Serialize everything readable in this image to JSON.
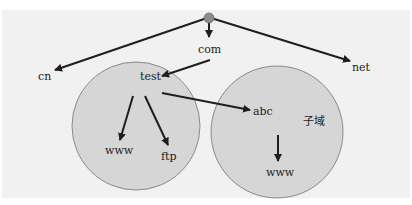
{
  "diagram": {
    "colors": {
      "background": "#f1f1f1",
      "zone_fill": "#d6d6d6",
      "zone_stroke": "#8a8a8a",
      "arrow": "#1e1e1e",
      "root_node": "#8c8c8c"
    },
    "nodes": {
      "root": "",
      "cn": "cn",
      "com": "com",
      "net": "net",
      "test": "test",
      "www1": "www",
      "ftp": "ftp",
      "abc": "abc",
      "www2": "www",
      "subdomain_label": "子域"
    },
    "edges": [
      {
        "from": "root",
        "to": "cn"
      },
      {
        "from": "root",
        "to": "com"
      },
      {
        "from": "root",
        "to": "net"
      },
      {
        "from": "com",
        "to": "test"
      },
      {
        "from": "test",
        "to": "www1"
      },
      {
        "from": "test",
        "to": "ftp"
      },
      {
        "from": "test",
        "to": "abc"
      },
      {
        "from": "abc",
        "to": "www2"
      }
    ],
    "zones": [
      {
        "name": "test-zone",
        "contains": [
          "test",
          "www1",
          "ftp"
        ]
      },
      {
        "name": "abc-subdomain-zone",
        "contains": [
          "abc",
          "www2"
        ],
        "label": "子域"
      }
    ]
  }
}
